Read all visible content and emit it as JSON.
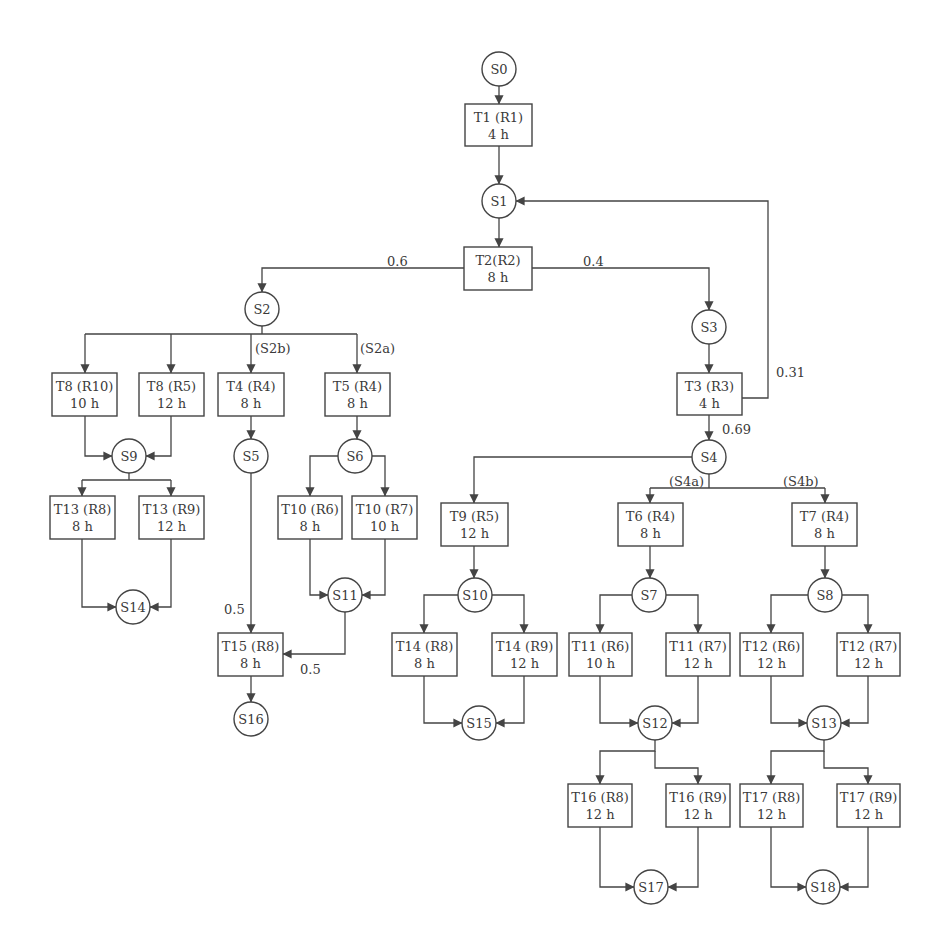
{
  "diagram": {
    "title": "",
    "colors": {
      "stroke": "#444444",
      "text": "#3a3a3a",
      "background": "#ffffff"
    },
    "states": [
      {
        "id": "S0",
        "label": "S0",
        "cx": 499,
        "cy": 69
      },
      {
        "id": "S1",
        "label": "S1",
        "cx": 499,
        "cy": 201
      },
      {
        "id": "S2",
        "label": "S2",
        "cx": 262,
        "cy": 309
      },
      {
        "id": "S3",
        "label": "S3",
        "cx": 709,
        "cy": 327
      },
      {
        "id": "S4",
        "label": "S4",
        "cx": 709,
        "cy": 457
      },
      {
        "id": "S5",
        "label": "S5",
        "cx": 251,
        "cy": 456
      },
      {
        "id": "S6",
        "label": "S6",
        "cx": 355,
        "cy": 456
      },
      {
        "id": "S7",
        "label": "S7",
        "cx": 649,
        "cy": 595
      },
      {
        "id": "S8",
        "label": "S8",
        "cx": 825,
        "cy": 595
      },
      {
        "id": "S9",
        "label": "S9",
        "cx": 129,
        "cy": 456
      },
      {
        "id": "S10",
        "label": "S10",
        "cx": 475,
        "cy": 595
      },
      {
        "id": "S11",
        "label": "S11",
        "cx": 345,
        "cy": 595
      },
      {
        "id": "S12",
        "label": "S12",
        "cx": 655,
        "cy": 723
      },
      {
        "id": "S13",
        "label": "S13",
        "cx": 824,
        "cy": 723
      },
      {
        "id": "S14",
        "label": "S14",
        "cx": 133,
        "cy": 607
      },
      {
        "id": "S15",
        "label": "S15",
        "cx": 479,
        "cy": 723
      },
      {
        "id": "S16",
        "label": "S16",
        "cx": 251,
        "cy": 719
      },
      {
        "id": "S17",
        "label": "S17",
        "cx": 651,
        "cy": 887
      },
      {
        "id": "S18",
        "label": "S18",
        "cx": 823,
        "cy": 887
      }
    ],
    "tasks": [
      {
        "id": "T1",
        "line1": "T1 (R1)",
        "line2": "4 h",
        "x": 465,
        "y": 104,
        "w": 67,
        "h": 42
      },
      {
        "id": "T2",
        "line1": "T2(R2)",
        "line2": "8 h",
        "x": 464,
        "y": 247,
        "w": 68,
        "h": 43
      },
      {
        "id": "T3",
        "line1": "T3 (R3)",
        "line2": "4 h",
        "x": 677,
        "y": 373,
        "w": 65,
        "h": 42
      },
      {
        "id": "T8-R10",
        "line1": "T8 (R10)",
        "line2": "10 h",
        "x": 52,
        "y": 373,
        "w": 65,
        "h": 43
      },
      {
        "id": "T8-R5",
        "line1": "T8 (R5)",
        "line2": "12 h",
        "x": 139,
        "y": 373,
        "w": 65,
        "h": 43
      },
      {
        "id": "T4",
        "line1": "T4 (R4)",
        "line2": "8 h",
        "x": 218,
        "y": 373,
        "w": 66,
        "h": 43
      },
      {
        "id": "T5",
        "line1": "T5 (R4)",
        "line2": "8 h",
        "x": 325,
        "y": 373,
        "w": 65,
        "h": 43
      },
      {
        "id": "T13-R8",
        "line1": "T13 (R8)",
        "line2": "8 h",
        "x": 50,
        "y": 496,
        "w": 65,
        "h": 43
      },
      {
        "id": "T13-R9",
        "line1": "T13 (R9)",
        "line2": "12 h",
        "x": 139,
        "y": 496,
        "w": 65,
        "h": 43
      },
      {
        "id": "T10-R6",
        "line1": "T10 (R6)",
        "line2": "8 h",
        "x": 278,
        "y": 496,
        "w": 64,
        "h": 43
      },
      {
        "id": "T10-R7",
        "line1": "T10 (R7)",
        "line2": "10 h",
        "x": 352,
        "y": 496,
        "w": 65,
        "h": 43
      },
      {
        "id": "T15",
        "line1": "T15 (R8)",
        "line2": "8 h",
        "x": 218,
        "y": 633,
        "w": 65,
        "h": 43
      },
      {
        "id": "T9",
        "line1": "T9 (R5)",
        "line2": "12 h",
        "x": 441,
        "y": 503,
        "w": 67,
        "h": 43
      },
      {
        "id": "T6",
        "line1": "T6 (R4)",
        "line2": "8 h",
        "x": 618,
        "y": 503,
        "w": 65,
        "h": 43
      },
      {
        "id": "T7",
        "line1": "T7 (R4)",
        "line2": "8 h",
        "x": 792,
        "y": 503,
        "w": 65,
        "h": 43
      },
      {
        "id": "T14-R8",
        "line1": "T14 (R8)",
        "line2": "8 h",
        "x": 392,
        "y": 633,
        "w": 65,
        "h": 43
      },
      {
        "id": "T14-R9",
        "line1": "T14 (R9)",
        "line2": "12 h",
        "x": 492,
        "y": 633,
        "w": 65,
        "h": 43
      },
      {
        "id": "T11-R6",
        "line1": "T11 (R6)",
        "line2": "10 h",
        "x": 569,
        "y": 633,
        "w": 63,
        "h": 43
      },
      {
        "id": "T11-R7",
        "line1": "T11 (R7)",
        "line2": "12 h",
        "x": 666,
        "y": 633,
        "w": 64,
        "h": 43
      },
      {
        "id": "T12-R6",
        "line1": "T12 (R6)",
        "line2": "12 h",
        "x": 740,
        "y": 633,
        "w": 63,
        "h": 43
      },
      {
        "id": "T12-R7",
        "line1": "T12 (R7)",
        "line2": "12 h",
        "x": 837,
        "y": 633,
        "w": 63,
        "h": 43
      },
      {
        "id": "T16-R8",
        "line1": "T16 (R8)",
        "line2": "12 h",
        "x": 568,
        "y": 784,
        "w": 64,
        "h": 43
      },
      {
        "id": "T16-R9",
        "line1": "T16 (R9)",
        "line2": "12 h",
        "x": 666,
        "y": 784,
        "w": 64,
        "h": 43
      },
      {
        "id": "T17-R8",
        "line1": "T17 (R8)",
        "line2": "12 h",
        "x": 740,
        "y": 784,
        "w": 63,
        "h": 43
      },
      {
        "id": "T17-R9",
        "line1": "T17 (R9)",
        "line2": "12 h",
        "x": 837,
        "y": 784,
        "w": 63,
        "h": 43
      }
    ],
    "edge_labels": [
      {
        "id": "p-s2",
        "text": "0.6",
        "x": 387,
        "y": 266
      },
      {
        "id": "p-s3",
        "text": "0.4",
        "x": 583,
        "y": 266
      },
      {
        "id": "p-loop",
        "text": "0.31",
        "x": 776,
        "y": 377
      },
      {
        "id": "p-s4",
        "text": "0.69",
        "x": 722,
        "y": 434
      },
      {
        "id": "l-s2b",
        "text": "(S2b)",
        "x": 255,
        "y": 353
      },
      {
        "id": "l-s2a",
        "text": "(S2a)",
        "x": 360,
        "y": 353
      },
      {
        "id": "l-s4a",
        "text": "(S4a)",
        "x": 669,
        "y": 486
      },
      {
        "id": "l-s4b",
        "text": "(S4b)",
        "x": 783,
        "y": 486
      },
      {
        "id": "p-s5",
        "text": "0.5",
        "x": 224,
        "y": 614
      },
      {
        "id": "p-s11",
        "text": "0.5",
        "x": 300,
        "y": 674
      }
    ],
    "edges": [
      {
        "id": "S0-T1",
        "d": "M499 86 L499 104",
        "arrow": true
      },
      {
        "id": "T1-S1",
        "d": "M499 146 L499 184",
        "arrow": true
      },
      {
        "id": "S1-T2",
        "d": "M499 218 L499 247",
        "arrow": true
      },
      {
        "id": "T2-S2",
        "d": "M464 268 L262 268 L262 292",
        "arrow": true
      },
      {
        "id": "T2-S3",
        "d": "M532 268 L709 268 L709 310",
        "arrow": true
      },
      {
        "id": "S3-T3",
        "d": "M709 344 L709 373",
        "arrow": true
      },
      {
        "id": "T3-S1",
        "d": "M742 398 L768 398 L768 201 L516 201",
        "arrow": true
      },
      {
        "id": "T3-S4",
        "d": "M709 415 L709 440",
        "arrow": true
      },
      {
        "id": "S2-bar",
        "d": "M262 326 L262 334 M85 334 L357 334",
        "arrow": false
      },
      {
        "id": "S2-T8a",
        "d": "M85 334 L85 373",
        "arrow": true
      },
      {
        "id": "S2-T8b",
        "d": "M171 334 L171 373",
        "arrow": true
      },
      {
        "id": "S2-T4",
        "d": "M251 334 L251 373",
        "arrow": true
      },
      {
        "id": "S2-T5",
        "d": "M357 334 L357 373",
        "arrow": true
      },
      {
        "id": "T8a-S9",
        "d": "M85 416 L85 456 L112 456",
        "arrow": true
      },
      {
        "id": "T8b-S9",
        "d": "M171 416 L171 456 L146 456",
        "arrow": true
      },
      {
        "id": "S9-bar",
        "d": "M129 473 L129 480 M82 480 L171 480",
        "arrow": false
      },
      {
        "id": "S9-T13a",
        "d": "M82 480 L82 496",
        "arrow": true
      },
      {
        "id": "S9-T13b",
        "d": "M171 480 L171 496",
        "arrow": true
      },
      {
        "id": "T13a-S14",
        "d": "M82 539 L82 607 L116 607",
        "arrow": true
      },
      {
        "id": "T13b-S14",
        "d": "M171 539 L171 607 L150 607",
        "arrow": true
      },
      {
        "id": "T4-S5",
        "d": "M251 416 L251 439",
        "arrow": true
      },
      {
        "id": "S5-T15",
        "d": "M251 473 L251 633",
        "arrow": true
      },
      {
        "id": "T5-S6",
        "d": "M357 416 L357 439",
        "arrow": true
      },
      {
        "id": "S6-T10a",
        "d": "M338 456 L310 456 L310 496",
        "arrow": true
      },
      {
        "id": "S6-T10b",
        "d": "M372 456 L385 456 L385 496",
        "arrow": true
      },
      {
        "id": "T10a-S11",
        "d": "M310 539 L310 595 L328 595",
        "arrow": true
      },
      {
        "id": "T10b-S11",
        "d": "M385 539 L385 595 L362 595",
        "arrow": true
      },
      {
        "id": "S11-T15",
        "d": "M345 612 L345 654 L283 654",
        "arrow": true
      },
      {
        "id": "T15-S16",
        "d": "M251 676 L251 702",
        "arrow": true
      },
      {
        "id": "S4-T9",
        "d": "M692 457 L474 457 L474 503",
        "arrow": true
      },
      {
        "id": "S4-bar",
        "d": "M709 474 L709 488 M650 488 L825 488",
        "arrow": false
      },
      {
        "id": "S4-T6",
        "d": "M650 488 L650 503",
        "arrow": true
      },
      {
        "id": "S4-T7",
        "d": "M825 488 L825 503",
        "arrow": true
      },
      {
        "id": "T9-S10",
        "d": "M474 546 L474 578",
        "arrow": true
      },
      {
        "id": "S10-T14a",
        "d": "M458 595 L424 595 L424 633",
        "arrow": true
      },
      {
        "id": "S10-T14b",
        "d": "M492 595 L524 595 L524 633",
        "arrow": true
      },
      {
        "id": "T14a-S15",
        "d": "M424 676 L424 723 L462 723",
        "arrow": true
      },
      {
        "id": "T14b-S15",
        "d": "M524 676 L524 723 L496 723",
        "arrow": true
      },
      {
        "id": "T6-S7",
        "d": "M650 546 L650 578",
        "arrow": true
      },
      {
        "id": "S7-T11a",
        "d": "M632 595 L600 595 L600 633",
        "arrow": true
      },
      {
        "id": "S7-T11b",
        "d": "M666 595 L698 595 L698 633",
        "arrow": true
      },
      {
        "id": "T11a-S12",
        "d": "M600 676 L600 723 L638 723",
        "arrow": true
      },
      {
        "id": "T11b-S12",
        "d": "M698 676 L698 723 L672 723",
        "arrow": true
      },
      {
        "id": "T7-S8",
        "d": "M825 546 L825 578",
        "arrow": true
      },
      {
        "id": "S8-T12a",
        "d": "M808 595 L771 595 L771 633",
        "arrow": true
      },
      {
        "id": "S8-T12b",
        "d": "M842 595 L868 595 L868 633",
        "arrow": true
      },
      {
        "id": "T12a-S13",
        "d": "M771 676 L771 723 L807 723",
        "arrow": true
      },
      {
        "id": "T12b-S13",
        "d": "M868 676 L868 723 L841 723",
        "arrow": true
      },
      {
        "id": "S12-T16a",
        "d": "M655 740 L655 751 L600 751 L600 784",
        "arrow": true
      },
      {
        "id": "S12-T16b",
        "d": "M655 751 L655 768 L698 768 L698 784",
        "arrow": true
      },
      {
        "id": "S13-T17a",
        "d": "M824 740 L824 751 L771 751 L771 784",
        "arrow": true
      },
      {
        "id": "S13-T17b",
        "d": "M824 751 L824 768 L868 768 L868 784",
        "arrow": true
      },
      {
        "id": "T16a-S17",
        "d": "M600 827 L600 887 L634 887",
        "arrow": true
      },
      {
        "id": "T16b-S17",
        "d": "M698 827 L698 887 L668 887",
        "arrow": true
      },
      {
        "id": "T17a-S18",
        "d": "M771 827 L771 887 L806 887",
        "arrow": true
      },
      {
        "id": "T17b-S18",
        "d": "M868 827 L868 887 L840 887",
        "arrow": true
      }
    ]
  }
}
